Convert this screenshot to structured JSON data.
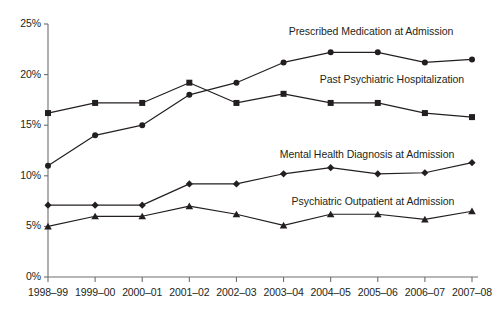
{
  "chart_data": {
    "type": "line",
    "title": "",
    "xlabel": "",
    "ylabel": "",
    "grid": false,
    "legend_position": "inline-annotations",
    "categories": [
      "1998–99",
      "1999–00",
      "2000–01",
      "2001–02",
      "2002–03",
      "2003–04",
      "2004–05",
      "2005–06",
      "2006–07",
      "2007–08"
    ],
    "ylim": [
      0,
      25
    ],
    "ytick_labels": [
      "0%",
      "5%",
      "10%",
      "15%",
      "20%",
      "25%"
    ],
    "ytick_values": [
      0,
      5,
      10,
      15,
      20,
      25
    ],
    "series": [
      {
        "name": "Prescribed Medication at Admission",
        "marker": "circle",
        "values": [
          11.0,
          14.0,
          15.0,
          18.0,
          19.2,
          21.2,
          22.2,
          22.2,
          21.2,
          21.5
        ]
      },
      {
        "name": "Past Psychiatric Hospitalization",
        "marker": "square",
        "values": [
          16.2,
          17.2,
          17.2,
          19.2,
          17.2,
          18.1,
          17.2,
          17.2,
          16.2,
          15.8
        ]
      },
      {
        "name": "Mental Health Diagnosis at Admission",
        "marker": "diamond",
        "values": [
          7.1,
          7.1,
          7.1,
          9.2,
          9.2,
          10.2,
          10.8,
          10.2,
          10.3,
          11.3
        ]
      },
      {
        "name": "Psychiatric Outpatient at Admission",
        "marker": "triangle",
        "values": [
          5.0,
          6.0,
          6.0,
          7.0,
          6.2,
          5.1,
          6.2,
          6.2,
          5.7,
          6.5
        ]
      }
    ],
    "annotations": [
      {
        "text": "Prescribed Medication at Admission",
        "x": 371,
        "y": 31
      },
      {
        "text": "Past Psychiatric Hospitalization",
        "x": 392,
        "y": 79
      },
      {
        "text": "Mental Health Diagnosis at Admission",
        "x": 367,
        "y": 154
      },
      {
        "text": "Psychiatric Outpatient at Admission",
        "x": 373,
        "y": 201
      }
    ],
    "colors": {
      "line": "#231f20",
      "marker": "#231f20",
      "axis": "#6d6e71",
      "text": "#231f20",
      "background": "#ffffff"
    }
  }
}
